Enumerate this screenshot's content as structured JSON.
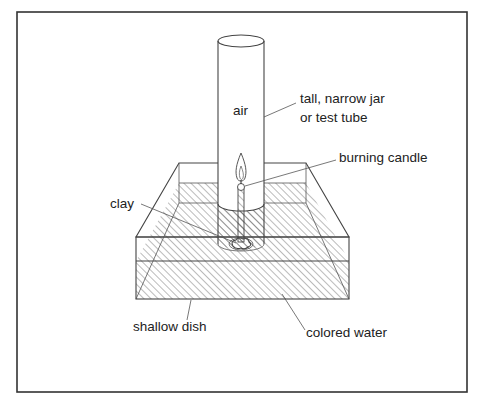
{
  "diagram": {
    "labels": {
      "air": "air",
      "jar_line1": "tall, narrow jar",
      "jar_line2": "or test tube",
      "candle": "burning candle",
      "clay": "clay",
      "dish": "shallow dish",
      "water": "colored water"
    },
    "colors": {
      "frame": "#333333",
      "lines": "#444444",
      "hatch": "#555555",
      "background": "#ffffff"
    }
  }
}
